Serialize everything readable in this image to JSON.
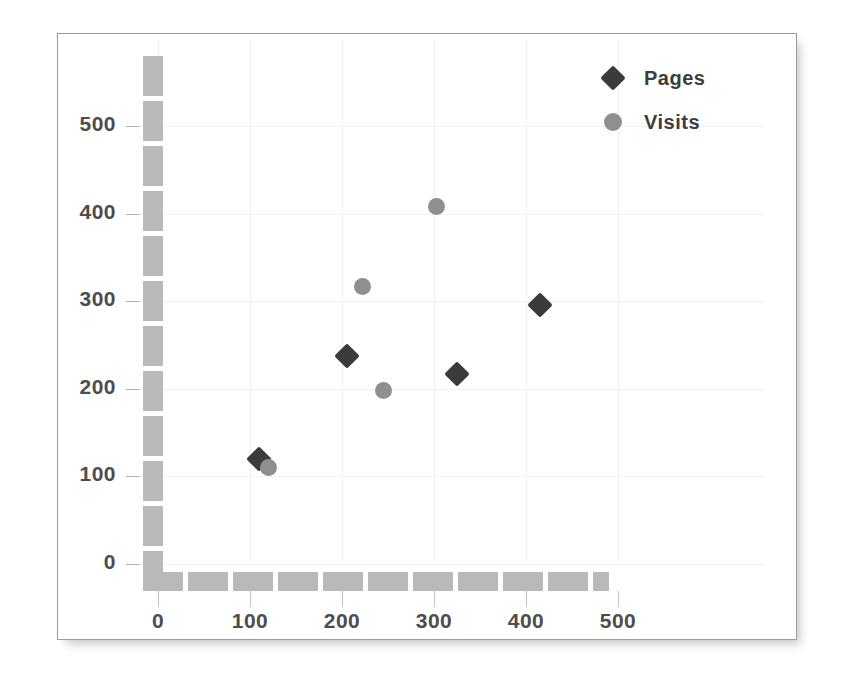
{
  "chart_data": {
    "type": "scatter",
    "title": "",
    "xlabel": "",
    "ylabel": "",
    "xlim": [
      0,
      500
    ],
    "ylim": [
      0,
      500
    ],
    "xticks": [
      "0",
      "100",
      "200",
      "300",
      "400",
      "500"
    ],
    "yticks": [
      "0",
      "100",
      "200",
      "300",
      "400",
      "500"
    ],
    "xtick_values": [
      0,
      100,
      200,
      300,
      400,
      500
    ],
    "ytick_values": [
      0,
      100,
      200,
      300,
      400,
      500
    ],
    "grid": true,
    "legend_position": "top-right",
    "series": [
      {
        "name": "Pages",
        "marker": "diamond",
        "color": "#3b3b3b",
        "points": [
          {
            "x": 110,
            "y": 120
          },
          {
            "x": 205,
            "y": 238
          },
          {
            "x": 325,
            "y": 217
          },
          {
            "x": 415,
            "y": 296
          }
        ]
      },
      {
        "name": "Visits",
        "marker": "circle",
        "color": "#8f8f8f",
        "points": [
          {
            "x": 120,
            "y": 110
          },
          {
            "x": 222,
            "y": 317
          },
          {
            "x": 245,
            "y": 198
          },
          {
            "x": 303,
            "y": 408
          }
        ]
      }
    ]
  },
  "legend": {
    "items": [
      {
        "label": "Pages",
        "marker": "diamond"
      },
      {
        "label": "Visits",
        "marker": "circle"
      }
    ]
  },
  "colors": {
    "pages": "#3b3b3b",
    "visits": "#8f8f8f",
    "axis_bar": "#b9b9b9",
    "gridline": "#f1f1f1",
    "text": "#4d4d4d",
    "border": "#9a9a9a",
    "background": "#ffffff"
  }
}
